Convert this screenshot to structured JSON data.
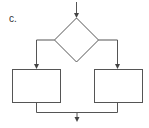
{
  "diagram": {
    "label": "c.",
    "type": "flowchart-if-else",
    "stroke_color": "#555555",
    "nodes": [
      {
        "id": "decision",
        "shape": "diamond",
        "text": ""
      },
      {
        "id": "left-process",
        "shape": "rectangle",
        "text": ""
      },
      {
        "id": "right-process",
        "shape": "rectangle",
        "text": ""
      }
    ],
    "edges": [
      {
        "from": "entry",
        "to": "decision"
      },
      {
        "from": "decision",
        "to": "left-process"
      },
      {
        "from": "decision",
        "to": "right-process"
      },
      {
        "from": "left-process",
        "to": "exit"
      },
      {
        "from": "right-process",
        "to": "exit"
      }
    ]
  }
}
